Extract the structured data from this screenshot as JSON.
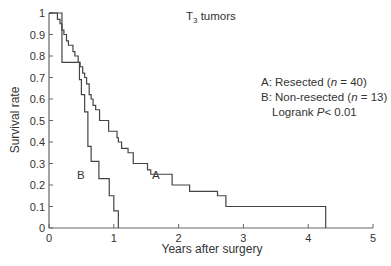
{
  "chart_data": {
    "type": "line",
    "subtype": "kaplan-meier step",
    "title": "T3 tumors",
    "title_main": "T",
    "title_sub": "3",
    "title_rest": " tumors",
    "xlabel": "Years after surgery",
    "ylabel": "Survival rate",
    "xlim": [
      0,
      5
    ],
    "ylim": [
      0,
      1
    ],
    "xticks": [
      "0",
      "1",
      "2",
      "3",
      "4",
      "5"
    ],
    "yticks": [
      "0",
      "0.1",
      "0.2",
      "0.3",
      "0.4",
      "0.5",
      "0.6",
      "0.7",
      "0.8",
      "0.9",
      "1"
    ],
    "grid": false,
    "series": [
      {
        "name": "A: Resected (n = 40)",
        "label": "A",
        "x": [
          0,
          0.13,
          0.17,
          0.2,
          0.23,
          0.27,
          0.3,
          0.37,
          0.4,
          0.45,
          0.48,
          0.52,
          0.55,
          0.58,
          0.62,
          0.65,
          0.68,
          0.72,
          0.78,
          0.92,
          1.05,
          1.07,
          1.12,
          1.22,
          1.3,
          1.52,
          1.57,
          1.9,
          2.17,
          2.6,
          2.73,
          4.27
        ],
        "values": [
          1.0,
          0.97,
          0.95,
          0.92,
          0.9,
          0.87,
          0.85,
          0.82,
          0.8,
          0.77,
          0.75,
          0.72,
          0.7,
          0.67,
          0.62,
          0.6,
          0.57,
          0.55,
          0.5,
          0.45,
          0.42,
          0.4,
          0.37,
          0.35,
          0.3,
          0.27,
          0.25,
          0.2,
          0.17,
          0.15,
          0.1,
          0.05
        ]
      },
      {
        "name": "B: Non-resected (n = 13)",
        "label": "B",
        "x": [
          0,
          0.2,
          0.47,
          0.5,
          0.55,
          0.6,
          0.65,
          0.77,
          0.93,
          1.0,
          1.07
        ],
        "values": [
          1.0,
          0.77,
          0.69,
          0.62,
          0.54,
          0.38,
          0.31,
          0.23,
          0.15,
          0.08,
          0.0
        ]
      }
    ],
    "legend": {
      "position": "right",
      "entries": [
        "A: Resected (n = 40)",
        "B: Non-resected (n = 13)"
      ],
      "stat": "Logrank P< 0.01"
    },
    "legend_lines": {
      "a_prefix": "A: Resected (",
      "a_n": "n",
      "a_suffix": " = 40)",
      "b_prefix": "B: Non-resected (",
      "b_n": "n",
      "b_suffix": " = 13)",
      "stat_prefix": "Logrank ",
      "stat_p": "P",
      "stat_suffix": "< 0.01"
    },
    "annotations": {
      "curve_a_label": "A",
      "curve_b_label": "B"
    },
    "line_color": "#444444"
  }
}
